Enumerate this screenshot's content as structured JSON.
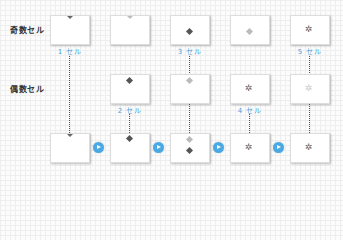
{
  "rows": {
    "odd_label": "奇数セル",
    "even_label": "偶数セル"
  },
  "captions": {
    "c1": "1 セル",
    "c2": "2 セル",
    "c3": "3 セル",
    "c4": "4 セル",
    "c5": "5 セル"
  },
  "icons": {
    "play": "play-circle-icon",
    "diamond": "diamond-icon",
    "burst": "splash-icon"
  },
  "colors": {
    "caption": "#4aa3df",
    "play_button": "#4aa9e5"
  }
}
